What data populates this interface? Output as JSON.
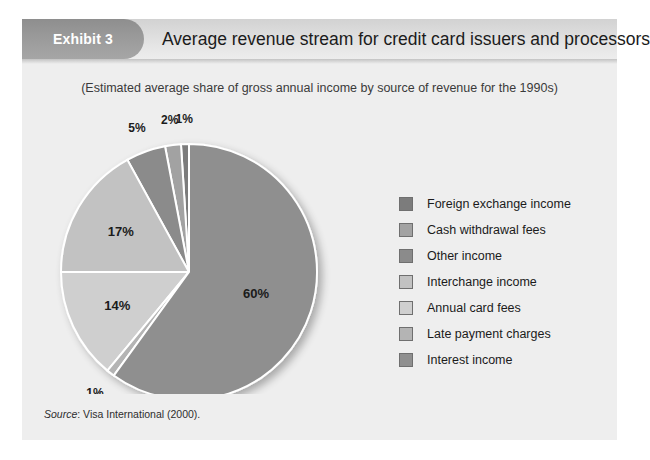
{
  "exhibit": {
    "badge_label": "Exhibit 3",
    "title": "Average revenue stream for credit card issuers and processors",
    "subtitle": "(Estimated average share of gross annual income by source of revenue for the 1990s)",
    "source_word": "Source",
    "source_rest": ": Visa International (2000)."
  },
  "colors": {
    "frame_background": "#eeeeee",
    "badge_background": "#9a9a9a",
    "header_background": "#dcdcdc",
    "label_text": "#1b1b1b"
  },
  "chart_data": {
    "type": "pie",
    "title": "Average revenue stream for credit card issuers and processors",
    "subtitle": "(Estimated average share of gross annual income by source of revenue for the 1990s)",
    "unit": "percent",
    "legend_position": "right",
    "start_angle_deg": 0,
    "direction": "counterclockwise",
    "categories": [
      "Foreign exchange income",
      "Cash withdrawal fees",
      "Other income",
      "Interchange income",
      "Annual card fees",
      "Late payment charges",
      "Interest income"
    ],
    "values": [
      1,
      2,
      5,
      17,
      14,
      1,
      60
    ],
    "data_labels": [
      "1%",
      "2%",
      "5%",
      "17%",
      "14%",
      "1%",
      "60%"
    ],
    "slice_colors": [
      "#7c7c7c",
      "#a2a2a2",
      "#8b8b8b",
      "#c2c2c2",
      "#cfcfcf",
      "#b4b4b4",
      "#8f8f8f"
    ],
    "total": 100
  },
  "legend": {
    "items": [
      {
        "label": "Foreign exchange income",
        "color": "#7c7c7c",
        "value": "1%"
      },
      {
        "label": "Cash withdrawal fees",
        "color": "#a2a2a2",
        "value": "2%"
      },
      {
        "label": "Other income",
        "color": "#8b8b8b",
        "value": "5%"
      },
      {
        "label": "Interchange income",
        "color": "#c2c2c2",
        "value": "17%"
      },
      {
        "label": "Annual card fees",
        "color": "#cfcfcf",
        "value": "14%"
      },
      {
        "label": "Late payment charges",
        "color": "#b4b4b4",
        "value": "1%"
      },
      {
        "label": "Interest income",
        "color": "#8f8f8f",
        "value": "60%"
      }
    ]
  }
}
